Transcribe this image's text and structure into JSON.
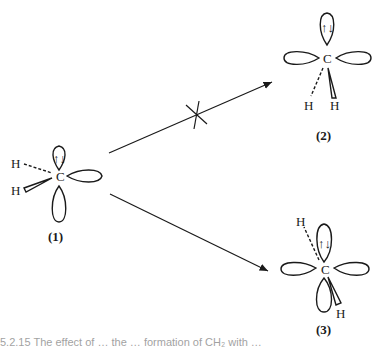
{
  "figure": {
    "structures": [
      {
        "id": "1",
        "label": "(1)",
        "center_atom": "C",
        "substituents": [
          "H",
          "H"
        ],
        "lone_pair": "↑↓"
      },
      {
        "id": "2",
        "label": "(2)",
        "center_atom": "C",
        "substituents": [
          "H",
          "H"
        ],
        "lone_pair": "↑↓"
      },
      {
        "id": "3",
        "label": "(3)",
        "center_atom": "C",
        "substituents": [
          "H",
          "H"
        ],
        "lone_pair": "↑↓"
      }
    ],
    "arrows": [
      {
        "from": "1",
        "to": "2",
        "forbidden": true
      },
      {
        "from": "1",
        "to": "3",
        "forbidden": false
      }
    ],
    "caption_partial": "5.2.15   The effect of … the … formation of CH₂ with …"
  }
}
